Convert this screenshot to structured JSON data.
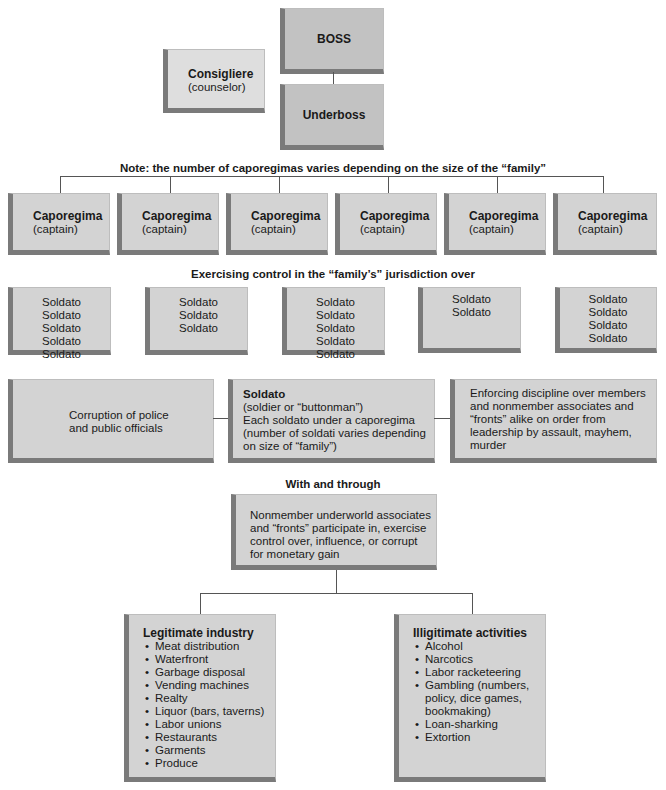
{
  "top": {
    "boss": "BOSS",
    "underboss": "Underboss",
    "consigliere": {
      "title": "Consigliere",
      "subtitle": "(counselor)"
    }
  },
  "captions": {
    "caporegima_note": "Note: the number of caporegimas varies depending on the size of the “family”",
    "control": "Exercising control in the “family’s” jurisdiction over",
    "with_through": "With and through"
  },
  "caporegimas": [
    {
      "title": "Caporegima",
      "subtitle": "(captain)"
    },
    {
      "title": "Caporegima",
      "subtitle": "(captain)"
    },
    {
      "title": "Caporegima",
      "subtitle": "(captain)"
    },
    {
      "title": "Caporegima",
      "subtitle": "(captain)"
    },
    {
      "title": "Caporegima",
      "subtitle": "(captain)"
    },
    {
      "title": "Caporegima",
      "subtitle": "(captain)"
    }
  ],
  "soldato_groups": [
    [
      "Soldato",
      "Soldato",
      "Soldato",
      "Soldato",
      "Soldato"
    ],
    [
      "Soldato",
      "Soldato",
      "Soldato"
    ],
    [
      "Soldato",
      "Soldato",
      "Soldato",
      "Soldato",
      "Soldato"
    ],
    [
      "Soldato",
      "Soldato"
    ],
    [
      "Soldato",
      "Soldato",
      "Soldato",
      "Soldato"
    ]
  ],
  "middle_row": {
    "corruption": [
      "Corruption of police",
      "and public officials"
    ],
    "soldato": {
      "title": "Soldato",
      "lines": [
        "(soldier or “buttonman”)",
        "Each soldato under a caporegima",
        "(number of soldati varies depending",
        "on size of “family”)"
      ]
    },
    "enforcing": [
      "Enforcing discipline over members",
      "and nonmember associates and",
      "“fronts” alike on order from",
      "leadership by assault, mayhem,",
      "murder"
    ]
  },
  "nonmember": [
    "Nonmember underworld associates",
    "and “fronts” participate in, exercise",
    "control over, influence, or corrupt",
    "for monetary gain"
  ],
  "legitimate": {
    "title": "Legitimate industry",
    "items": [
      "Meat distribution",
      "Waterfront",
      "Garbage disposal",
      "Vending machines",
      "Realty",
      "Liquor (bars, taverns)",
      "Labor unions",
      "Restaurants",
      "Garments",
      "Produce"
    ]
  },
  "illegitimate": {
    "title": "Illigitimate activities",
    "items": [
      "Alcohol",
      "Narcotics",
      "Labor racketeering",
      "Gambling (numbers, policy, dice games, bookmaking)",
      "Loan-sharking",
      "Extortion"
    ]
  }
}
